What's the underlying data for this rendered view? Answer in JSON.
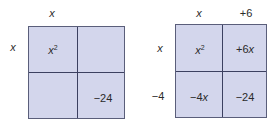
{
  "left_box": {
    "top_labels": [
      "x"
    ],
    "side_labels": [
      "x"
    ],
    "cells": {
      "top_left": {
        "base": "x",
        "exp": "2"
      },
      "top_right": "",
      "bottom_left": "",
      "bottom_right": "−24"
    }
  },
  "right_box": {
    "top_labels": [
      "x",
      "+6"
    ],
    "side_labels": [
      "x",
      "−4"
    ],
    "cells": {
      "top_left": {
        "base": "x",
        "exp": "2"
      },
      "top_right": {
        "coef": "+6",
        "var": "x"
      },
      "bottom_left": {
        "coef": "−4",
        "var": "x"
      },
      "bottom_right": "−24"
    }
  },
  "colors": {
    "cell_fill": "#d3d6ec",
    "grid_line": "#3c4060"
  }
}
